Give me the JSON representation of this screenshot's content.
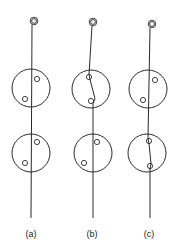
{
  "figure": {
    "panels": [
      {
        "id": "a",
        "label": "(a)",
        "description": "Line passes straight through both large circles; small circles off the line",
        "ring": {
          "cx": 34,
          "cy": 21
        },
        "line": {
          "x1": 32,
          "y1": 25,
          "x2": 31,
          "y2": 218
        },
        "upper_circle": {
          "cx": 31,
          "cy": 88,
          "r": 19
        },
        "upper_dots": [
          {
            "cx": 37,
            "cy": 79
          },
          {
            "cx": 25,
            "cy": 99
          }
        ],
        "lower_circle": {
          "cx": 31,
          "cy": 153,
          "r": 19
        },
        "lower_dots": [
          {
            "cx": 37,
            "cy": 142
          },
          {
            "cx": 25,
            "cy": 163
          }
        ],
        "label_pos": {
          "x": 31,
          "y": 234
        }
      },
      {
        "id": "b",
        "label": "(b)",
        "description": "Line bends through both small dots in the upper circle",
        "ring": {
          "cx": 93,
          "cy": 22
        },
        "line_points": [
          [
            92,
            26
          ],
          [
            89,
            76
          ],
          [
            95,
            101
          ],
          [
            93,
            218
          ]
        ],
        "upper_circle": {
          "cx": 91,
          "cy": 89,
          "r": 19
        },
        "upper_dots": [
          {
            "cx": 89,
            "cy": 77
          },
          {
            "cx": 90,
            "cy": 101
          }
        ],
        "lower_circle": {
          "cx": 93,
          "cy": 153,
          "r": 19
        },
        "lower_dots": [
          {
            "cx": 97,
            "cy": 142
          },
          {
            "cx": 84,
            "cy": 163
          }
        ],
        "label_pos": {
          "x": 92,
          "y": 234
        }
      },
      {
        "id": "c",
        "label": "(c)",
        "description": "Line straight through upper circle, bends through both dots of the lower circle",
        "ring": {
          "cx": 152,
          "cy": 24
        },
        "line_points": [
          [
            149,
            28
          ],
          [
            148,
            140
          ],
          [
            150,
            165
          ],
          [
            150,
            218
          ]
        ],
        "upper_circle": {
          "cx": 148,
          "cy": 89,
          "r": 19
        },
        "upper_dots": [
          {
            "cx": 155,
            "cy": 80
          },
          {
            "cx": 143,
            "cy": 100
          }
        ],
        "lower_circle": {
          "cx": 148,
          "cy": 153,
          "r": 19
        },
        "lower_dots": [
          {
            "cx": 149,
            "cy": 141
          },
          {
            "cx": 149,
            "cy": 166
          }
        ],
        "label_pos": {
          "x": 149,
          "y": 234
        }
      }
    ],
    "colors": {
      "ink": "#2a2a2a",
      "background": "#ffffff"
    }
  }
}
